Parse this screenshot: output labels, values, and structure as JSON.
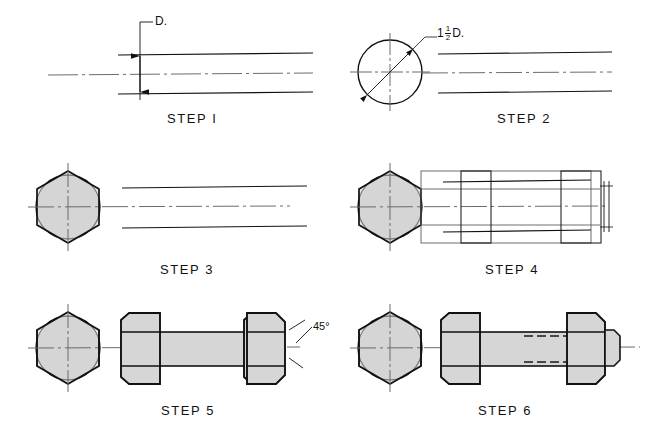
{
  "figure": {
    "type": "technical-drawing",
    "steps": [
      {
        "id": 1,
        "label": "STEP I",
        "numeral": "I"
      },
      {
        "id": 2,
        "label": "STEP 2",
        "numeral": "2"
      },
      {
        "id": 3,
        "label": "STEP 3",
        "numeral": "3"
      },
      {
        "id": 4,
        "label": "STEP 4",
        "numeral": "4"
      },
      {
        "id": 5,
        "label": "STEP 5",
        "numeral": "5"
      },
      {
        "id": 6,
        "label": "STEP 6",
        "numeral": "6"
      }
    ]
  },
  "annotations": {
    "diameter": "D.",
    "across_corners_whole": "1",
    "across_corners_num": "1",
    "across_corners_den": "2",
    "across_corners_unit": "D.",
    "chamfer_angle": "45°"
  },
  "colors": {
    "object_line": "#111111",
    "construction_line": "#5d5d5d",
    "center_line": "#6b6b6b",
    "hidden_line": "#1a1a1a",
    "fill_grey": "#d6d6d6",
    "fill_grey_light": "#dcdcdc",
    "paper": "#ffffff"
  }
}
